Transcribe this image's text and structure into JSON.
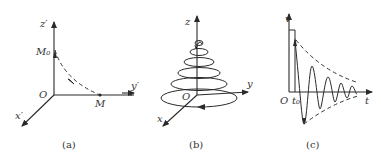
{
  "panels": [
    {
      "id": "a",
      "caption": "(a)",
      "labels": {
        "z_axis": "z′",
        "y_axis": "y′",
        "x_axis": "x′",
        "origin": "O",
        "start_point": "M₀",
        "end_point": "M"
      }
    },
    {
      "id": "b",
      "caption": "(b)",
      "labels": {
        "z_axis": "z",
        "y_axis": "y",
        "x_axis": "x",
        "origin": "O"
      }
    },
    {
      "id": "c",
      "caption": "(c)",
      "labels": {
        "v_axis": "v",
        "t_axis": "t",
        "origin": "O",
        "t_mark": "t₀"
      }
    }
  ],
  "colors": {
    "line": "#2a2a2a",
    "background": "#ffffff"
  }
}
